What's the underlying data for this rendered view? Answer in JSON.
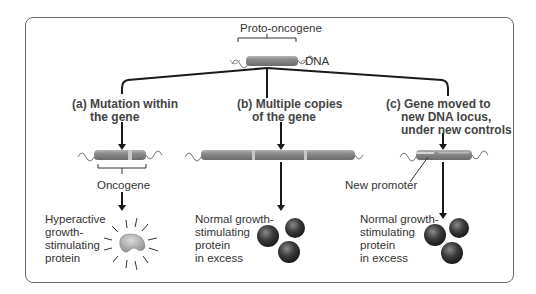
{
  "title": "Proto-oncogene",
  "dna_label": "DNA",
  "branches": [
    {
      "heading_line1": "(a) Mutation within",
      "heading_line2": "the gene",
      "result_label": "Oncogene",
      "protein_line1": "Hyperactive",
      "protein_line2": "growth-",
      "protein_line3": "stimulating",
      "protein_line4": "protein"
    },
    {
      "heading_line1": "(b) Multiple copies",
      "heading_line2": "of the gene",
      "protein_line1": "Normal growth-",
      "protein_line2": "stimulating",
      "protein_line3": "protein",
      "protein_line4": "in excess"
    },
    {
      "heading_line1": "(c) Gene moved to",
      "heading_line2": "new DNA locus,",
      "heading_line3": "under new controls",
      "promoter_label": "New promoter",
      "protein_line1": "Normal growth-",
      "protein_line2": "stimulating",
      "protein_line3": "protein",
      "protein_line4": "in excess"
    }
  ],
  "colors": {
    "gene_bar": "#8f8f8f",
    "gene_highlight": "#c8c8c8",
    "protein_sphere": "#3a3a3a",
    "hyperactive_protein": "#b0b0b0",
    "frame": "#6b6b6b",
    "lines": "#1a1a1a"
  }
}
